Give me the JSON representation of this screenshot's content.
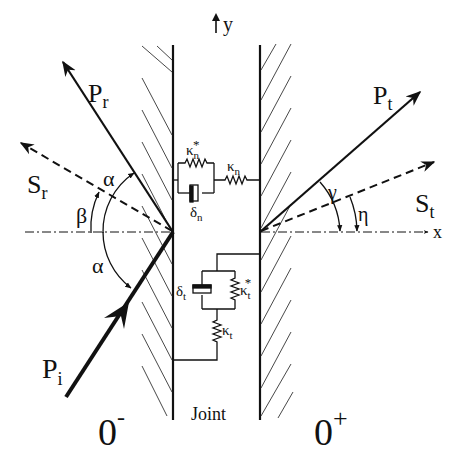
{
  "diagram": {
    "axes": {
      "x_label": "x",
      "y_label": "y"
    },
    "waves": {
      "incident_p": {
        "label": "P",
        "sub": "i"
      },
      "reflected_p": {
        "label": "P",
        "sub": "r"
      },
      "reflected_s": {
        "label": "S",
        "sub": "r"
      },
      "transmitted_p": {
        "label": "P",
        "sub": "t"
      },
      "transmitted_s": {
        "label": "S",
        "sub": "t"
      }
    },
    "angles": {
      "alpha_top": "α",
      "alpha_bottom": "α",
      "beta": "β",
      "gamma": "γ",
      "eta": "η"
    },
    "joint": {
      "label": "Joint",
      "normal": {
        "kappa_star": {
          "sym": "κ",
          "sub": "n",
          "sup": "*"
        },
        "kappa": {
          "sym": "κ",
          "sub": "n"
        },
        "delta": {
          "sym": "δ",
          "sub": "n"
        }
      },
      "tangential": {
        "kappa_star": {
          "sym": "κ",
          "sub": "t",
          "sup": "*"
        },
        "kappa": {
          "sym": "κ",
          "sub": "t"
        },
        "delta": {
          "sym": "δ",
          "sub": "t"
        }
      }
    },
    "sides": {
      "left": {
        "label": "0",
        "sup": "-"
      },
      "right": {
        "label": "0",
        "sup": "+"
      }
    }
  }
}
